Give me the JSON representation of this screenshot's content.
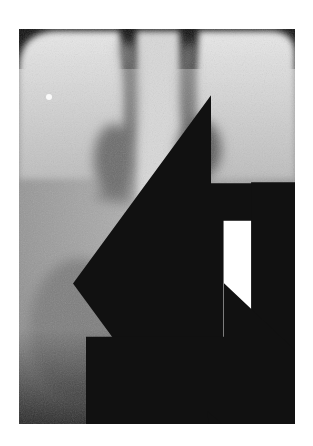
{
  "image": {
    "kind": "dental periapical radiograph",
    "tone": "grayscale",
    "background": "#ffffff",
    "film_bounds": {
      "x": 19,
      "y": 29,
      "width": 276,
      "height": 395
    }
  },
  "annotations": [
    {
      "id": "arrow-upper-left",
      "style": "solid-with-white-slot",
      "direction": "left",
      "x": 82,
      "y": 100
    },
    {
      "id": "arrow-upper-right",
      "style": "solid-with-white-slot",
      "direction": "right",
      "x": 234,
      "y": 100
    },
    {
      "id": "arrow-middle",
      "style": "solid",
      "direction": "right",
      "x": 104,
      "y": 232
    },
    {
      "id": "arrow-lower-left",
      "style": "outline",
      "direction": "right",
      "x": 100,
      "y": 325
    },
    {
      "id": "arrow-lower-right",
      "style": "outline",
      "direction": "left",
      "x": 195,
      "y": 320
    }
  ],
  "colors": {
    "arrow_fill": "#111111",
    "arrow_slot": "#ffffff",
    "bone": "#c8c8c8",
    "enamel": "#e6e6e6",
    "radiolucent": "#4a4a4a"
  }
}
